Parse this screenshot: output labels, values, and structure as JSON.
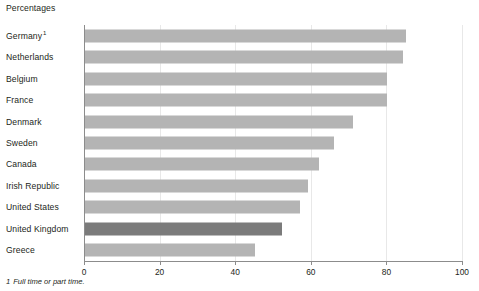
{
  "title": "Percentages",
  "footnote": {
    "marker": "1",
    "text": "Full time or part time."
  },
  "colors": {
    "bar": "#b4b4b4",
    "bar_highlight": "#7b7b7b",
    "axis": "#8c8c8c",
    "gridline": "#e8e8e8",
    "text": "#231f20"
  },
  "chart_data": {
    "type": "bar",
    "orientation": "horizontal",
    "title": "Percentages",
    "xlabel": "",
    "ylabel": "",
    "xlim": [
      0,
      100
    ],
    "xticks": [
      0,
      20,
      40,
      60,
      80,
      100
    ],
    "xtick_labels": [
      "0",
      "20",
      "40",
      "60",
      "80",
      "100"
    ],
    "grid": true,
    "legend": "none",
    "highlight_category": "United Kingdom",
    "categories": [
      "Germany",
      "Netherlands",
      "Belgium",
      "France",
      "Denmark",
      "Sweden",
      "Canada",
      "Irish Republic",
      "United States",
      "United Kingdom",
      "Greece"
    ],
    "category_labels": [
      "Germany",
      "Netherlands",
      "Belgium",
      "France",
      "Denmark",
      "Sweden",
      "Canada",
      "Irish Republic",
      "United States",
      "United Kingdom",
      "Greece"
    ],
    "category_footnote_markers": [
      "1",
      "",
      "",
      "",
      "",
      "",
      "",
      "",
      "",
      "",
      ""
    ],
    "values": [
      85,
      84,
      80,
      80,
      71,
      66,
      62,
      59,
      57,
      52,
      45
    ],
    "annotations": [
      "1 Full time or part time."
    ]
  }
}
